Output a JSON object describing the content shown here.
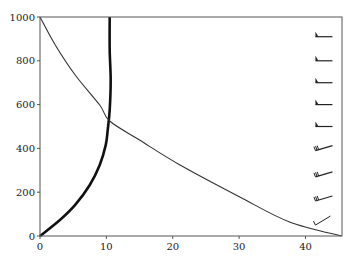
{
  "chart_data": {
    "type": "line",
    "title": "",
    "xlabel": "",
    "ylabel": "",
    "xlim": [
      0,
      45.5
    ],
    "ylim": [
      0,
      1000
    ],
    "grid": false,
    "x_ticks": [
      0,
      10,
      20,
      30,
      40
    ],
    "y_ticks": [
      0,
      200,
      400,
      600,
      800,
      1000
    ],
    "series": [
      {
        "name": "bold-curve",
        "style": "thick",
        "color": "#111111",
        "x": [
          0,
          3.0,
          5.3,
          7.5,
          9.0,
          9.9,
          10.2,
          10.5,
          10.65,
          10.5,
          10.5
        ],
        "y": [
          0,
          73,
          142,
          233,
          324,
          415,
          484,
          575,
          712,
          849,
          1000
        ]
      },
      {
        "name": "thin-curve",
        "style": "thin",
        "color": "#333333",
        "x": [
          0,
          2.3,
          5.3,
          9.0,
          10.5,
          15.0,
          21.1,
          30.1,
          37.6,
          45.4
        ],
        "y": [
          1000,
          872,
          735,
          598,
          525,
          438,
          324,
          178,
          64,
          0
        ]
      }
    ],
    "wind_barbs": {
      "x": 41.5,
      "levels": [
        50,
        160,
        270,
        390,
        500,
        600,
        700,
        800,
        910
      ],
      "description": [
        "light-calm",
        "barbed",
        "barbed",
        "barbed",
        "flag",
        "flag",
        "flag",
        "flag",
        "flag"
      ]
    }
  }
}
